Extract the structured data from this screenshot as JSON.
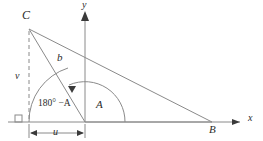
{
  "figure": {
    "type": "geometry-diagram",
    "stroke_color": "#8a8a8a",
    "label_color": "#2b2b2b",
    "background": "#ffffff"
  },
  "axes": {
    "x_label": "x",
    "y_label": "y",
    "origin": {
      "x": 85,
      "y": 122
    }
  },
  "vertices": {
    "C": {
      "label": "C",
      "x": 29,
      "y": 29
    },
    "B": {
      "label": "B",
      "x": 212,
      "y": 122
    },
    "O": {
      "label": "",
      "x": 85,
      "y": 122
    }
  },
  "segments": {
    "b": {
      "label": "b",
      "from": "C",
      "to": "O"
    },
    "v": {
      "label": "v",
      "type": "dashed-altitude"
    },
    "u": {
      "label": "u",
      "type": "dimension"
    }
  },
  "angles": {
    "interior": {
      "label": "A"
    },
    "exterior": {
      "label": "180° −A"
    }
  },
  "markers": {
    "right_angle": "right-angle-square",
    "arc_arrow": "arc-arrowhead"
  }
}
